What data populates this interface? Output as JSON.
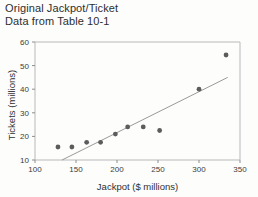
{
  "heading": {
    "line1": "Original Jackpot/Ticket",
    "line2": "Data from Table 10-1"
  },
  "chart_data": {
    "type": "scatter",
    "title": "Original Jackpot/Ticket Data from Table 10-1",
    "xlabel": "Jackpot ($ millions)",
    "ylabel": "Tickets (millions)",
    "xlim": [
      100,
      350
    ],
    "ylim": [
      10,
      60
    ],
    "xticks": [
      100,
      150,
      200,
      250,
      300,
      350
    ],
    "yticks": [
      10,
      20,
      30,
      40,
      50,
      60
    ],
    "xtick_labels": [
      "100",
      "150",
      "200",
      "250",
      "300",
      "350"
    ],
    "ytick_labels": [
      "10",
      "20",
      "30",
      "40",
      "50",
      "60"
    ],
    "grid": false,
    "legend": "none",
    "marker": "filled-circle",
    "marker_color": "#5c5c5c",
    "points": [
      {
        "x": 128,
        "y": 15.5
      },
      {
        "x": 145,
        "y": 15.5
      },
      {
        "x": 163,
        "y": 17.5
      },
      {
        "x": 180,
        "y": 17.5
      },
      {
        "x": 198,
        "y": 21.0
      },
      {
        "x": 213,
        "y": 24.0
      },
      {
        "x": 232,
        "y": 24.0
      },
      {
        "x": 252,
        "y": 22.5
      },
      {
        "x": 300,
        "y": 40.0
      },
      {
        "x": 333,
        "y": 54.5
      }
    ],
    "trendline": {
      "type": "linear",
      "color": "#9a9a9a",
      "x_start": 133,
      "y_start": 10.0,
      "x_end": 335,
      "y_end": 45.0
    }
  },
  "colors": {
    "frame": "#b9b9b9",
    "marker": "#5c5c5c",
    "trend": "#9a9a9a",
    "text": "#2e2e2e",
    "background": "#fdfdfc"
  }
}
